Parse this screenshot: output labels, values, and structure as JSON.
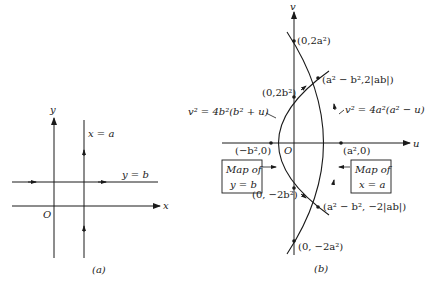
{
  "panel_a": {
    "caption": "(a)",
    "x_axis_label": "x",
    "y_axis_label": "y",
    "origin_label": "O",
    "vertical_line_label": "x = a",
    "horizontal_line_label": "y = b"
  },
  "panel_b": {
    "caption": "(b)",
    "u_axis_label": "u",
    "v_axis_label": "v",
    "origin_label": "O",
    "points": {
      "top_v": "(0,2a²)",
      "upper_intersection": "(a² − b²,2|ab|)",
      "upper_b": "(0,2b²)",
      "left_u": "(−b²,0)",
      "right_u": "(a²,0)",
      "lower_b": "(0, −2b²)",
      "lower_intersection": "(a² − b², −2|ab|)",
      "bottom_v": "(0, −2a²)"
    },
    "curve_b_equation": "v² = 4b²(b² + u)",
    "curve_a_equation": "v² = 4a²(a² − u)",
    "box_left": {
      "line1": "Map of",
      "line2": "y = b"
    },
    "box_right": {
      "line1": "Map of",
      "line2": "x = a"
    }
  }
}
